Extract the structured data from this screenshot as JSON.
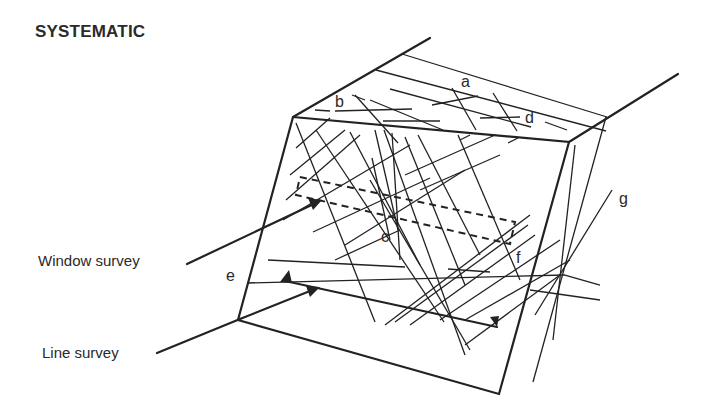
{
  "title": "SYSTEMATIC",
  "labels": {
    "window_survey": "Window survey",
    "line_survey": "Line survey"
  },
  "discontinuity_letters": {
    "a": "a",
    "b": "b",
    "c": "c",
    "d": "d",
    "e": "e",
    "f": "f",
    "g": "g"
  },
  "colors": {
    "line": "#222222",
    "background": "#ffffff"
  }
}
